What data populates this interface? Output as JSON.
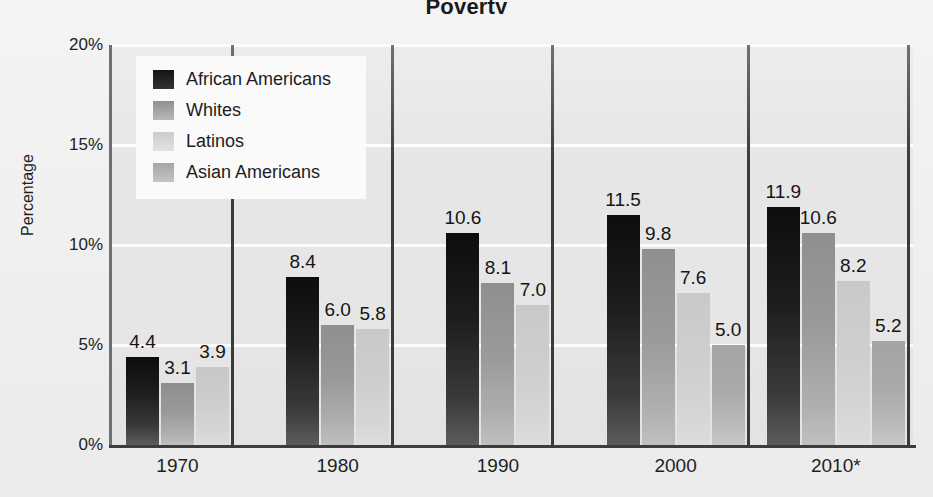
{
  "figure": {
    "title_partial": "Poverty",
    "background_color": "#f2f2f2",
    "plot_background_color": "#e6e6e6",
    "gridline_color": "#fdfdfd"
  },
  "axes": {
    "ylabel": "Percentage",
    "yticks": [
      "0%",
      "5%",
      "10%",
      "15%",
      "20%"
    ],
    "ytick_values": [
      0,
      5,
      10,
      15,
      20
    ],
    "xticks": [
      "1970",
      "1980",
      "1990",
      "2000",
      "2010*"
    ]
  },
  "legend": {
    "items": [
      {
        "label": "African Americans",
        "color": "#1a1a1a"
      },
      {
        "label": "Whites",
        "color": "#9a9a9a"
      },
      {
        "label": "Latinos",
        "color": "#cfcfcf"
      },
      {
        "label": "Asian Americans",
        "color": "#ababab"
      }
    ]
  },
  "chart_data": {
    "type": "bar",
    "title": "Poverty",
    "xlabel": "",
    "ylabel": "Percentage",
    "ylim": [
      0,
      20
    ],
    "yticks": [
      0,
      5,
      10,
      15,
      20
    ],
    "ytick_labels": [
      "0%",
      "5%",
      "10%",
      "15%",
      "20%"
    ],
    "grid": true,
    "legend_position": "upper-left-inside",
    "categories": [
      "1970",
      "1980",
      "1990",
      "2000",
      "2010*"
    ],
    "series": [
      {
        "name": "African Americans",
        "color": "#1a1a1a",
        "values": [
          4.4,
          8.4,
          10.6,
          11.5,
          11.9
        ]
      },
      {
        "name": "Whites",
        "color": "#9a9a9a",
        "values": [
          3.1,
          6.0,
          8.1,
          9.8,
          10.6
        ]
      },
      {
        "name": "Latinos",
        "color": "#cfcfcf",
        "values": [
          3.9,
          5.8,
          7.0,
          7.6,
          8.2
        ]
      },
      {
        "name": "Asian Americans",
        "color": "#ababab",
        "values": [
          null,
          null,
          null,
          5.0,
          5.2
        ]
      }
    ],
    "data_labels": [
      [
        "4.4",
        "3.1",
        "3.9",
        ""
      ],
      [
        "8.4",
        "6.0",
        "5.8",
        ""
      ],
      [
        "10.6",
        "8.1",
        "7.0",
        ""
      ],
      [
        "11.5",
        "9.8",
        "7.6",
        "5.0"
      ],
      [
        "11.9",
        "10.6",
        "8.2",
        "5.2"
      ]
    ],
    "note": "2010 values marked with asterisk"
  }
}
